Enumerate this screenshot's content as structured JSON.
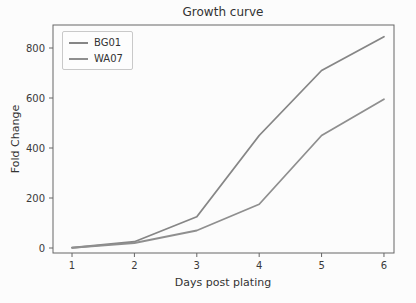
{
  "chart_data": {
    "type": "line",
    "title": "Growth curve",
    "xlabel": "Days post plating",
    "ylabel": "Fold Change",
    "x": [
      1,
      2,
      3,
      4,
      5,
      6
    ],
    "xticks": [
      1,
      2,
      3,
      4,
      5,
      6
    ],
    "yticks": [
      0,
      200,
      400,
      600,
      800
    ],
    "xlim": [
      0.695,
      6.161
    ],
    "ylim": [
      -20,
      892
    ],
    "grid": false,
    "legend_position": "upper-left",
    "series": [
      {
        "name": "BG01",
        "color": "#868686",
        "values": [
          1,
          25,
          125,
          450,
          710,
          845
        ]
      },
      {
        "name": "WA07",
        "color": "#8f8f8f",
        "values": [
          1,
          20,
          70,
          175,
          450,
          595
        ]
      }
    ],
    "colors": {
      "axis": "#666666",
      "text": "#3a3a3a",
      "background": "#fcfcfc",
      "legend_border": "#c9c9c9"
    }
  }
}
